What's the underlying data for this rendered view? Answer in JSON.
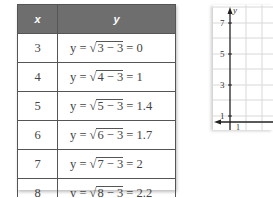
{
  "table": {
    "headers": [
      "x",
      "y"
    ],
    "rows": [
      {
        "x": "3",
        "expr_pre": "y = √",
        "radicand": "3 − 3",
        "result": " = 0"
      },
      {
        "x": "4",
        "expr_pre": "y = √",
        "radicand": "4 − 3",
        "result": " = 1"
      },
      {
        "x": "5",
        "expr_pre": "y = √",
        "radicand": "5 − 3",
        "result": " = 1.4"
      },
      {
        "x": "6",
        "expr_pre": "y = √",
        "radicand": "6 − 3",
        "result": " = 1.7"
      },
      {
        "x": "7",
        "expr_pre": "y = √",
        "radicand": "7 − 3",
        "result": " = 2"
      },
      {
        "x": "8",
        "expr_pre": "y = √",
        "radicand": "8 − 3",
        "result": " = 2.2"
      }
    ]
  },
  "graph": {
    "y_axis_label": "y",
    "y_ticks": [
      "7",
      "5",
      "3",
      "1"
    ],
    "x_ticks": [
      "1"
    ]
  },
  "colors": {
    "header_bg": "#6e6e6e",
    "grid": "#d8d8d8",
    "axis": "#222222"
  }
}
